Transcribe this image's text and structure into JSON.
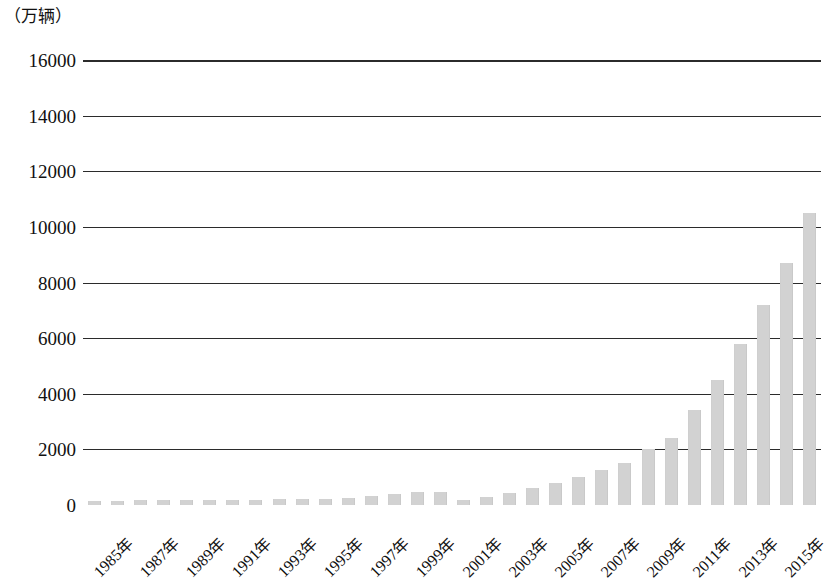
{
  "chart_data": {
    "type": "bar",
    "title": "",
    "subtitle": "",
    "unit_caption": "（万辆）",
    "ylabel": "",
    "xlabel": "",
    "ylim": [
      0,
      16000
    ],
    "ytick_labels": [
      "16000",
      "14000",
      "12000",
      "10000",
      "8000",
      "6000",
      "4000",
      "2000",
      "0"
    ],
    "ytick_values": [
      16000,
      14000,
      12000,
      10000,
      8000,
      6000,
      4000,
      2000,
      0
    ],
    "grid": "horizontal",
    "legend": "none",
    "bar_color": "#d2d2d2",
    "axis_color": "#2b2b2b",
    "categories": [
      "1985年",
      "1986年",
      "1987年",
      "1988年",
      "1989年",
      "1990年",
      "1991年",
      "1992年",
      "1993年",
      "1994年",
      "1995年",
      "1996年",
      "1997年",
      "1998年",
      "1999年",
      "2000年",
      "2001年",
      "2002年",
      "2003年",
      "2004年",
      "2005年",
      "2006年",
      "2007年",
      "2008年",
      "2009年",
      "2010年",
      "2011年",
      "2012年",
      "2013年",
      "2014年",
      "2015年",
      "2016年"
    ],
    "values": [
      150,
      160,
      170,
      175,
      170,
      165,
      170,
      180,
      200,
      210,
      230,
      260,
      330,
      400,
      450,
      480,
      190,
      280,
      420,
      600,
      800,
      1000,
      1250,
      1500,
      2000,
      2400,
      3400,
      4500,
      5800,
      7200,
      8700,
      10500
    ],
    "xtick_labels": [
      "1985年",
      "1987年",
      "1989年",
      "1991年",
      "1993年",
      "1995年",
      "1997年",
      "1999年",
      "2001年",
      "2003年",
      "2005年",
      "2007年",
      "2009年",
      "2011年",
      "2013年",
      "2015年"
    ],
    "xtick_indices": [
      0,
      2,
      4,
      6,
      8,
      10,
      12,
      14,
      16,
      18,
      20,
      22,
      24,
      26,
      28,
      30
    ]
  }
}
